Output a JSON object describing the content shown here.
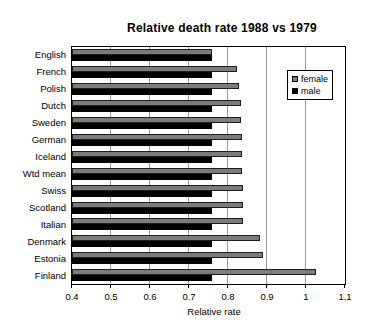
{
  "chart_data": {
    "type": "bar",
    "orientation": "horizontal",
    "title": "Relative death rate 1988 vs 1979",
    "xlabel": "Relative rate",
    "categories": [
      "English",
      "French",
      "Polish",
      "Dutch",
      "Sweden",
      "German",
      "Iceland",
      "Wtd mean",
      "Swiss",
      "Scotland",
      "Italian",
      "Denmark",
      "Estonia",
      "Finland"
    ],
    "series": [
      {
        "name": "female",
        "color": "#7b7b7b",
        "values": [
          0.76,
          0.824,
          0.829,
          0.832,
          0.833,
          0.835,
          0.835,
          0.836,
          0.838,
          0.838,
          0.838,
          0.881,
          0.889,
          1.025
        ]
      },
      {
        "name": "male",
        "color": "#000000",
        "values": [
          0.76,
          0.76,
          0.76,
          0.76,
          0.76,
          0.76,
          0.76,
          0.76,
          0.76,
          0.76,
          0.76,
          0.76,
          0.76,
          0.76
        ]
      }
    ],
    "xlim": [
      0.4,
      1.1
    ],
    "xticks": [
      "0.4",
      "0.5",
      "0.6",
      "0.7",
      "0.8",
      "0.9",
      "1",
      "1.1"
    ],
    "grid": true,
    "legend_position": "inside-right",
    "plot_background": "#ffffff"
  }
}
